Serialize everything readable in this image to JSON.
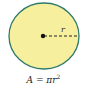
{
  "diagram": {
    "shape": "circle",
    "fill_color": "#f6ef9e",
    "stroke_color": "#2f7a6c",
    "center_dot_color": "#111111",
    "radius_label": "r",
    "formula_lhs": "A = πr",
    "formula_exponent": "2"
  }
}
